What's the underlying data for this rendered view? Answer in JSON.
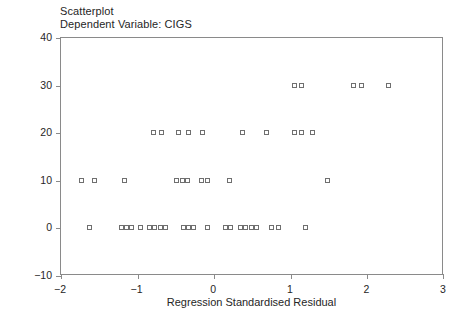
{
  "title": "Scatterplot",
  "subtitle": "Dependent Variable: CIGS",
  "axes": {
    "x_title": "Regression Standardised Residual",
    "y_title": "CIGS",
    "x_ticks": [
      "-2",
      "-1",
      "0",
      "1",
      "2",
      "3"
    ],
    "y_ticks": [
      "40",
      "30",
      "20",
      "10",
      "0",
      "-10"
    ]
  },
  "chart_data": {
    "type": "scatter",
    "title": "Scatterplot",
    "subtitle": "Dependent Variable: CIGS",
    "xlabel": "Regression Standardised Residual",
    "ylabel": "CIGS",
    "xlim": [
      -2,
      3
    ],
    "ylim": [
      -10,
      40
    ],
    "xticks": [
      -2,
      -1,
      0,
      1,
      2,
      3
    ],
    "yticks": [
      -10,
      0,
      10,
      20,
      30,
      40
    ],
    "grid": false,
    "legend": "none",
    "marker": "open-square",
    "marker_color": "#6f6f6f",
    "series": [
      {
        "name": "CIGS vs Regression Standardised Residual",
        "points": [
          [
            1.05,
            30
          ],
          [
            1.15,
            30
          ],
          [
            1.82,
            30
          ],
          [
            1.93,
            30
          ],
          [
            2.28,
            30
          ],
          [
            -0.79,
            20
          ],
          [
            -0.68,
            20
          ],
          [
            -0.46,
            20
          ],
          [
            -0.33,
            20
          ],
          [
            -0.14,
            20
          ],
          [
            0.38,
            20
          ],
          [
            0.69,
            20
          ],
          [
            1.05,
            20
          ],
          [
            1.15,
            20
          ],
          [
            1.29,
            20
          ],
          [
            -1.72,
            10
          ],
          [
            -1.55,
            10
          ],
          [
            -1.16,
            10
          ],
          [
            -0.48,
            10
          ],
          [
            -0.41,
            10
          ],
          [
            -0.34,
            10
          ],
          [
            -0.16,
            10
          ],
          [
            -0.08,
            10
          ],
          [
            0.21,
            10
          ],
          [
            1.48,
            10
          ],
          [
            -1.62,
            0
          ],
          [
            -1.21,
            0
          ],
          [
            -1.14,
            0
          ],
          [
            -1.07,
            0
          ],
          [
            -0.95,
            0
          ],
          [
            -0.84,
            0
          ],
          [
            -0.77,
            0
          ],
          [
            -0.7,
            0
          ],
          [
            -0.63,
            0
          ],
          [
            -0.4,
            0
          ],
          [
            -0.33,
            0
          ],
          [
            -0.26,
            0
          ],
          [
            -0.08,
            0
          ],
          [
            0.15,
            0
          ],
          [
            0.22,
            0
          ],
          [
            0.35,
            0
          ],
          [
            0.42,
            0
          ],
          [
            0.49,
            0
          ],
          [
            0.56,
            0
          ],
          [
            0.76,
            0
          ],
          [
            0.84,
            0
          ],
          [
            1.2,
            0
          ]
        ]
      }
    ]
  }
}
